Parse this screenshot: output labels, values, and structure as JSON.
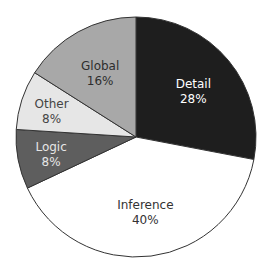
{
  "chart_data": {
    "type": "pie",
    "title": "",
    "start_angle_deg": 0,
    "direction": "clockwise",
    "slices": [
      {
        "label": "Detail",
        "value": 28,
        "display": "28%",
        "color": "#1e1e1e",
        "text_color": "#ffffff"
      },
      {
        "label": "Inference",
        "value": 40,
        "display": "40%",
        "color": "#ffffff",
        "text_color": "#333333"
      },
      {
        "label": "Logic",
        "value": 8,
        "display": "8%",
        "color": "#5e5e5e",
        "text_color": "#e6e6e6"
      },
      {
        "label": "Other",
        "value": 8,
        "display": "8%",
        "color": "#e6e6e6",
        "text_color": "#444444"
      },
      {
        "label": "Global",
        "value": 16,
        "display": "16%",
        "color": "#a8a8a8",
        "text_color": "#2e2e2e"
      }
    ],
    "legend": "none",
    "labels_inside": true
  }
}
